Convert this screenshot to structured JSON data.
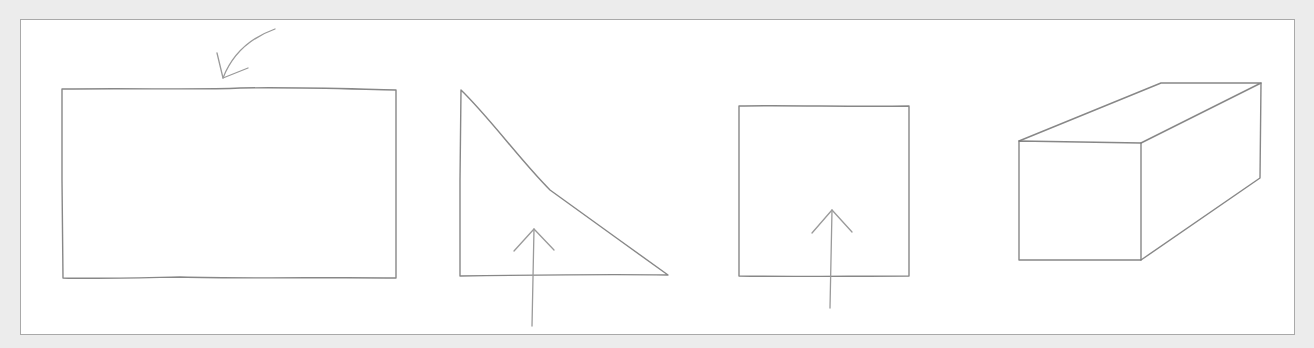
{
  "figure": {
    "colors": {
      "background": "#ececec",
      "panel": "#ffffff",
      "panel_border": "#a9a9a9",
      "stroke": "#7a7a7a",
      "arrow_stroke": "#9a9a9a"
    },
    "shapes": [
      {
        "name": "rectangle",
        "x": 62,
        "y": 88,
        "width": 334,
        "height": 190,
        "annotation": "curved-arrow-pointing-to-top-edge"
      },
      {
        "name": "right-triangle",
        "points": [
          [
            460,
            90
          ],
          [
            460,
            275
          ],
          [
            668,
            275
          ]
        ],
        "annotation": "up-arrow-through-bottom-edge"
      },
      {
        "name": "square",
        "x": 739,
        "y": 106,
        "width": 170,
        "height": 170,
        "annotation": "up-arrow-through-bottom-edge"
      },
      {
        "name": "rectangular-prism",
        "front_face": {
          "x": 1019,
          "y": 140,
          "width": 122,
          "height": 120
        },
        "depth_offset": [
          120,
          -57
        ]
      }
    ]
  }
}
